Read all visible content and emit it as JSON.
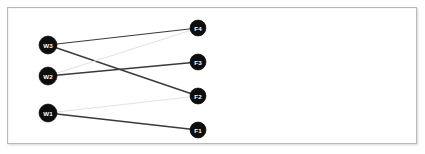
{
  "panel": {
    "background_color": "#ffffff",
    "border_color": "#b9b9b9"
  },
  "graph": {
    "type": "bipartite-graph",
    "node_fill_color": "#0d0d0d",
    "node_label_color": "#ffffff",
    "edge_strong_color": "#3a3a3a",
    "edge_faint_color": "#e3e3e3",
    "left_nodes": [
      {
        "id": "W3",
        "label": "W3",
        "cx": 40,
        "cy": 37,
        "r": 9
      },
      {
        "id": "W2",
        "label": "W2",
        "cx": 40,
        "cy": 68,
        "r": 9
      },
      {
        "id": "W1",
        "label": "W1",
        "cx": 40,
        "cy": 105,
        "r": 9
      }
    ],
    "right_nodes": [
      {
        "id": "F4",
        "label": "F4",
        "cx": 190,
        "cy": 20,
        "r": 8
      },
      {
        "id": "F3",
        "label": "F3",
        "cx": 190,
        "cy": 54,
        "r": 8
      },
      {
        "id": "F2",
        "label": "F2",
        "cx": 190,
        "cy": 88,
        "r": 8
      },
      {
        "id": "F1",
        "label": "F1",
        "cx": 190,
        "cy": 122,
        "r": 8
      }
    ],
    "edges": [
      {
        "from": "W3",
        "to": "F4",
        "weight": "strong",
        "color": "#3a3a3a",
        "width": 1.2
      },
      {
        "from": "W3",
        "to": "F2",
        "weight": "strong",
        "color": "#3a3a3a",
        "width": 1.4
      },
      {
        "from": "W2",
        "to": "F3",
        "weight": "strong",
        "color": "#3a3a3a",
        "width": 1.5
      },
      {
        "from": "W2",
        "to": "F4",
        "weight": "faint",
        "color": "#e3e3e3",
        "width": 1.2
      },
      {
        "from": "W1",
        "to": "F2",
        "weight": "faint",
        "color": "#e3e3e3",
        "width": 1.2
      },
      {
        "from": "W1",
        "to": "F1",
        "weight": "strong",
        "color": "#3a3a3a",
        "width": 1.4
      }
    ]
  }
}
